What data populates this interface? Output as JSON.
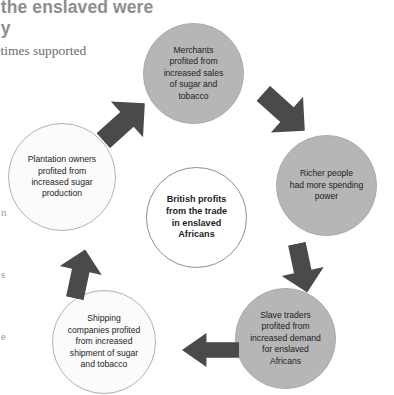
{
  "page": {
    "heading_lines": [
      "y the enslaved were",
      "ely"
    ],
    "body_line": "metimes supported",
    "margin_fragments": [
      "n",
      "s",
      "e"
    ]
  },
  "diagram": {
    "center": {
      "label": "British profits\nfrom the trade\nin enslaved\nAfricans",
      "fill": "#ffffff",
      "stroke": "#8f8f8f"
    },
    "nodes": [
      {
        "id": "merchants",
        "label": "Merchants\nprofited from\nincreased sales\nof sugar and\ntobacco",
        "fill": "#b6b6b6",
        "position": "top"
      },
      {
        "id": "richer-people",
        "label": "Richer people\nhad more spending\npower",
        "fill": "#b6b6b6",
        "position": "right"
      },
      {
        "id": "slave-traders",
        "label": "Slave traders\nprofited from\nincreased demand\nfor enslaved\nAfricans",
        "fill": "#b6b6b6",
        "position": "bottom-right"
      },
      {
        "id": "shipping-companies",
        "label": "Shipping\ncompanies profited\nfrom increased\nshipment of sugar\nand tobacco",
        "fill": "#fbfbfb",
        "position": "bottom-left"
      },
      {
        "id": "plantation-owners",
        "label": "Plantation owners\nprofited from\nincreased sugar\nproduction",
        "fill": "#fbfbfb",
        "position": "left"
      }
    ],
    "arrows": [
      {
        "id": "plantation-to-merchants",
        "direction": "up-right",
        "color": "#4a4a4a"
      },
      {
        "id": "merchants-to-richer-people",
        "direction": "down-right",
        "color": "#4a4a4a"
      },
      {
        "id": "richer-people-to-slave-traders",
        "direction": "down",
        "color": "#4a4a4a"
      },
      {
        "id": "slave-traders-to-shipping",
        "direction": "left",
        "color": "#4a4a4a"
      },
      {
        "id": "shipping-to-plantation",
        "direction": "up",
        "color": "#4a4a4a"
      }
    ]
  }
}
